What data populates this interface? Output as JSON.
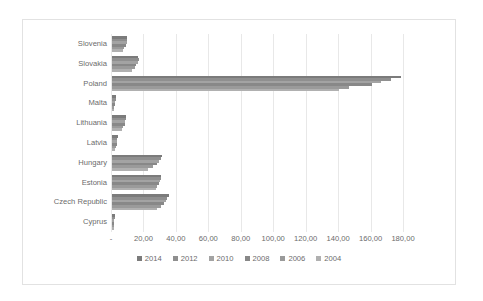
{
  "chart_data": {
    "type": "bar",
    "orientation": "horizontal",
    "title": "",
    "xlabel": "",
    "ylabel": "",
    "xlim": [
      0,
      180
    ],
    "grid": true,
    "legend_position": "bottom",
    "xticks": [
      "-",
      "20,00",
      "40,00",
      "60,00",
      "80,00",
      "100,00",
      "120,00",
      "140,00",
      "160,00",
      "180,00"
    ],
    "xtick_values": [
      0,
      20,
      40,
      60,
      80,
      100,
      120,
      140,
      160,
      180
    ],
    "categories": [
      "Slovenia",
      "Slovakia",
      "Poland",
      "Malta",
      "Lithuania",
      "Latvia",
      "Hungary",
      "Estonia",
      "Czech Republic",
      "Cyprus"
    ],
    "series": [
      {
        "name": "2014",
        "color": "#7b7b7b",
        "values": [
          9.0,
          16.0,
          178.0,
          2.5,
          8.5,
          3.5,
          31.0,
          30.0,
          35.0,
          1.8
        ]
      },
      {
        "name": "2012",
        "color": "#8f8f8f",
        "values": [
          9.5,
          16.5,
          172.0,
          2.2,
          8.5,
          3.2,
          30.0,
          30.0,
          34.0,
          1.6
        ]
      },
      {
        "name": "2010",
        "color": "#a3a3a3",
        "values": [
          9.0,
          16.0,
          166.0,
          2.0,
          8.0,
          3.0,
          29.0,
          29.5,
          33.0,
          1.5
        ]
      },
      {
        "name": "2008",
        "color": "#888888",
        "values": [
          8.5,
          15.0,
          160.0,
          1.8,
          8.0,
          2.8,
          28.0,
          29.0,
          32.0,
          1.4
        ]
      },
      {
        "name": "2006",
        "color": "#9a9a9a",
        "values": [
          7.5,
          14.0,
          146.0,
          1.5,
          7.0,
          2.5,
          25.0,
          28.0,
          30.0,
          1.2
        ]
      },
      {
        "name": "2004",
        "color": "#b0b0b0",
        "values": [
          6.5,
          12.5,
          140.0,
          1.2,
          6.0,
          2.0,
          22.0,
          27.0,
          28.0,
          1.0
        ]
      }
    ]
  },
  "legend": {
    "items": [
      {
        "label": "2014",
        "color": "#7b7b7b"
      },
      {
        "label": "2012",
        "color": "#8f8f8f"
      },
      {
        "label": "2010",
        "color": "#a3a3a3"
      },
      {
        "label": "2008",
        "color": "#888888"
      },
      {
        "label": "2006",
        "color": "#9a9a9a"
      },
      {
        "label": "2004",
        "color": "#b0b0b0"
      }
    ]
  }
}
